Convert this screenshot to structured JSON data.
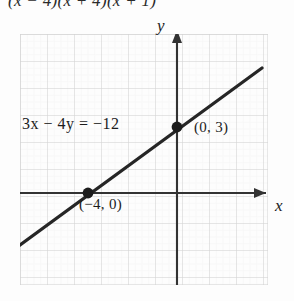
{
  "figure": {
    "top_formula": "(x − 4)(x + 4)(x + 1)",
    "equation_label": "3x − 4y = −12",
    "axis_label_x": "x",
    "axis_label_y": "y",
    "points": [
      {
        "name": "y-intercept",
        "label": "(0, 3)",
        "x": 0,
        "y": 3
      },
      {
        "name": "x-intercept",
        "label": "(−4, 0)",
        "x": -4,
        "y": 0
      }
    ],
    "colors": {
      "grid": "#d9d9d9",
      "grid_minor": "#ececec",
      "axis": "#333333",
      "line": "#262626",
      "text": "#1c1c1c",
      "background": "#fdfdfd"
    },
    "chart": {
      "type": "line",
      "slope": 0.75,
      "intercept": 3,
      "grid": true
    }
  }
}
